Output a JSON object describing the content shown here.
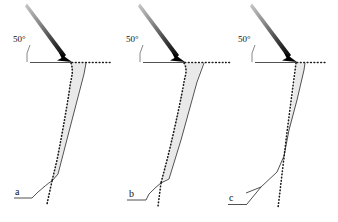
{
  "figure": {
    "type": "scientific-diagram",
    "background_color": "#ffffff",
    "ink_color": "#1a1a1a",
    "shade_fill_color": "#e9e9e9",
    "shade_stroke_color": "#555555",
    "arrow_head_color": "#000000",
    "arrow_tail_color": "#b9b9b9"
  },
  "panels": [
    {
      "id": "a",
      "label": "a",
      "angle_label": "50°",
      "angle_degrees": 50,
      "arrow": {
        "name": "impact-arrow",
        "tail": [
          27,
          4
        ],
        "head": [
          72,
          62
        ]
      },
      "surface": {
        "solid_from": [
          30,
          62
        ],
        "solid_to": [
          72,
          62
        ],
        "dotted_to": [
          110,
          62
        ]
      },
      "shaded_zone": {
        "present": true,
        "width_class": "medium",
        "fill": "#e9e9e9"
      },
      "profiles": {
        "original_dotted": "left boundary of shaded zone",
        "deformed_solid": "right boundary of shaded zone"
      },
      "base_line": {
        "from": [
          14,
          198
        ],
        "to": [
          32,
          198
        ]
      }
    },
    {
      "id": "b",
      "label": "b",
      "angle_label": "50°",
      "angle_degrees": 50,
      "arrow": {
        "name": "impact-arrow",
        "tail": [
          140,
          4
        ],
        "head": [
          185,
          62
        ]
      },
      "surface": {
        "solid_from": [
          143,
          62
        ],
        "solid_to": [
          185,
          62
        ],
        "dotted_to": [
          222,
          62
        ]
      },
      "shaded_zone": {
        "present": true,
        "width_class": "wide",
        "fill": "#e9e9e9"
      },
      "profiles": {
        "original_dotted": "left boundary of shaded zone",
        "deformed_solid": "right boundary of shaded zone"
      },
      "base_line": {
        "from": [
          127,
          200
        ],
        "to": [
          146,
          200
        ]
      }
    },
    {
      "id": "c",
      "label": "c",
      "angle_label": "50°",
      "angle_degrees": 50,
      "arrow": {
        "name": "impact-arrow",
        "tail": [
          252,
          4
        ],
        "head": [
          297,
          62
        ]
      },
      "surface": {
        "solid_from": [
          255,
          62
        ],
        "solid_to": [
          297,
          62
        ],
        "dotted_to": [
          327,
          62
        ]
      },
      "shaded_zone": {
        "present": true,
        "width_class": "narrow",
        "fill": "#e9e9e9"
      },
      "profiles": {
        "original_dotted": "straight dotted reference line",
        "deformed_solid": "kinked solid deformed profile"
      },
      "base_line": {
        "from": [
          228,
          204
        ],
        "to": [
          247,
          204
        ]
      },
      "left_edge_dots": true
    }
  ]
}
